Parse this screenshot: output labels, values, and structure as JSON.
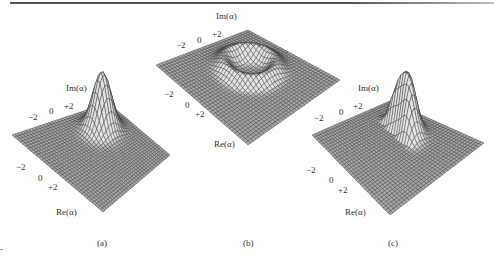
{
  "figure": {
    "panels": [
      {
        "id": "a",
        "caption": "(a)",
        "surface": "single-peak",
        "im_axis": {
          "title": "Im(α)",
          "ticks": [
            "−2",
            "0",
            "+2"
          ]
        },
        "re_axis": {
          "title": "Re(α)",
          "ticks": [
            "−2",
            "0",
            "+2"
          ]
        }
      },
      {
        "id": "b",
        "caption": "(b)",
        "surface": "ring-crater",
        "im_axis": {
          "title": "Im(α)",
          "ticks": [
            "−2",
            "0",
            "+2"
          ]
        },
        "re_axis": {
          "title": "Re(α)",
          "ticks": [
            "−2",
            "0",
            "+2"
          ]
        }
      },
      {
        "id": "c",
        "caption": "(c)",
        "surface": "crescent-peak",
        "im_axis": {
          "title": "Im(α)",
          "ticks": [
            "−2",
            "0",
            "+2"
          ]
        },
        "re_axis": {
          "title": "Re(α)",
          "ticks": [
            "−2",
            "0",
            "+2"
          ]
        }
      }
    ],
    "colors": {
      "mesh_fill": "#a9a9a9",
      "mesh_line": "#3a3a3a",
      "text": "#333333"
    }
  }
}
